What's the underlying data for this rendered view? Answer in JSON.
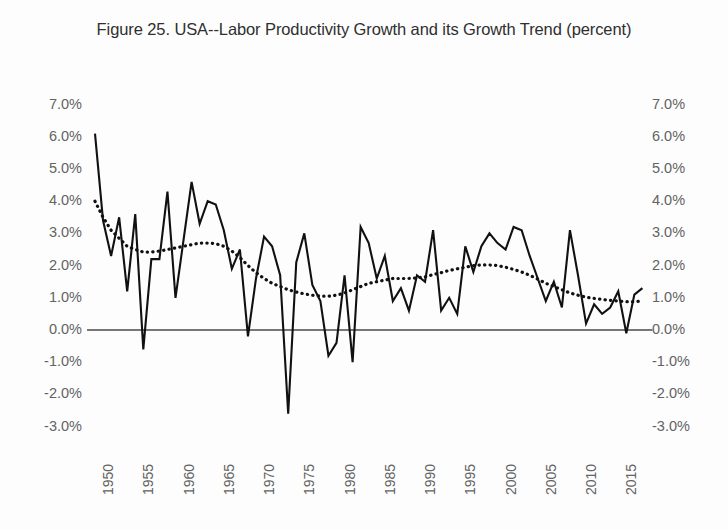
{
  "chart_data": {
    "type": "line",
    "title": "Figure 25. USA--Labor Productivity Growth and its Growth Trend (percent)",
    "xlabel": "",
    "ylabel": "",
    "ylim": [
      -3.0,
      7.0
    ],
    "xlim": [
      1950,
      2018
    ],
    "ytick_labels": [
      "7.0%",
      "6.0%",
      "5.0%",
      "4.0%",
      "3.0%",
      "2.0%",
      "1.0%",
      "0.0%",
      "-1.0%",
      "-2.0%",
      "-3.0%"
    ],
    "ytick_values": [
      7.0,
      6.0,
      5.0,
      4.0,
      3.0,
      2.0,
      1.0,
      0.0,
      -1.0,
      -2.0,
      -3.0
    ],
    "xtick_labels": [
      "1950",
      "1955",
      "1960",
      "1965",
      "1970",
      "1975",
      "1980",
      "1985",
      "1990",
      "1995",
      "2000",
      "2005",
      "2010",
      "2015"
    ],
    "xtick_values": [
      1950,
      1955,
      1960,
      1965,
      1970,
      1975,
      1980,
      1985,
      1990,
      1995,
      2000,
      2005,
      2010,
      2015
    ],
    "grid": false,
    "legend_position": "none",
    "dual_y_axis": true,
    "axis_units": "percent",
    "zero_reference_line": 0.0,
    "x": [
      1950,
      1951,
      1952,
      1953,
      1954,
      1955,
      1956,
      1957,
      1958,
      1959,
      1960,
      1961,
      1962,
      1963,
      1964,
      1965,
      1966,
      1967,
      1968,
      1969,
      1970,
      1971,
      1972,
      1973,
      1974,
      1975,
      1976,
      1977,
      1978,
      1979,
      1980,
      1981,
      1982,
      1983,
      1984,
      1985,
      1986,
      1987,
      1988,
      1989,
      1990,
      1991,
      1992,
      1993,
      1994,
      1995,
      1996,
      1997,
      1998,
      1999,
      2000,
      2001,
      2002,
      2003,
      2004,
      2005,
      2006,
      2007,
      2008,
      2009,
      2010,
      2011,
      2012,
      2013,
      2014,
      2015,
      2016,
      2017,
      2018
    ],
    "series": [
      {
        "name": "Labor Productivity Growth",
        "style": "solid",
        "color": "#111111",
        "values": [
          6.1,
          3.4,
          2.3,
          3.5,
          1.2,
          3.6,
          -0.6,
          2.2,
          2.2,
          4.3,
          1.0,
          2.8,
          4.6,
          3.3,
          4.0,
          3.9,
          3.1,
          1.9,
          2.5,
          -0.2,
          1.6,
          2.9,
          2.6,
          1.7,
          -2.6,
          2.1,
          3.0,
          1.4,
          0.9,
          -0.8,
          -0.4,
          1.7,
          -1.0,
          3.2,
          2.7,
          1.6,
          2.3,
          0.9,
          1.3,
          0.6,
          1.7,
          1.5,
          3.1,
          0.6,
          1.0,
          0.5,
          2.6,
          1.8,
          2.6,
          3.0,
          2.7,
          2.5,
          3.2,
          3.1,
          2.3,
          1.6,
          0.9,
          1.5,
          0.7,
          3.1,
          1.7,
          0.2,
          0.8,
          0.5,
          0.7,
          1.2,
          -0.1,
          1.1,
          1.3
        ]
      },
      {
        "name": "Growth Trend",
        "style": "dotted",
        "color": "#111111",
        "values": [
          4.0,
          3.5,
          3.1,
          2.85,
          2.6,
          2.5,
          2.42,
          2.42,
          2.45,
          2.5,
          2.55,
          2.6,
          2.65,
          2.7,
          2.7,
          2.68,
          2.6,
          2.45,
          2.25,
          2.0,
          1.78,
          1.6,
          1.45,
          1.35,
          1.25,
          1.18,
          1.12,
          1.08,
          1.05,
          1.05,
          1.08,
          1.15,
          1.25,
          1.35,
          1.45,
          1.5,
          1.55,
          1.6,
          1.6,
          1.6,
          1.62,
          1.65,
          1.72,
          1.78,
          1.85,
          1.9,
          1.95,
          2.0,
          2.02,
          2.02,
          2.0,
          1.95,
          1.88,
          1.8,
          1.7,
          1.58,
          1.45,
          1.35,
          1.25,
          1.15,
          1.08,
          1.02,
          0.98,
          0.95,
          0.92,
          0.9,
          0.88,
          0.88,
          0.9
        ]
      }
    ]
  },
  "axes": {
    "left_labels": [
      "7.0%",
      "6.0%",
      "5.0%",
      "4.0%",
      "3.0%",
      "2.0%",
      "1.0%",
      "0.0%",
      "-1.0%",
      "-2.0%",
      "-3.0%"
    ],
    "right_labels": [
      "7.0%",
      "6.0%",
      "5.0%",
      "4.0%",
      "3.0%",
      "2.0%",
      "1.0%",
      "0.0%",
      "-1.0%",
      "-2.0%",
      "-3.0%"
    ],
    "x_labels": [
      "1950",
      "1955",
      "1960",
      "1965",
      "1970",
      "1975",
      "1980",
      "1985",
      "1990",
      "1995",
      "2000",
      "2005",
      "2010",
      "2015"
    ]
  }
}
